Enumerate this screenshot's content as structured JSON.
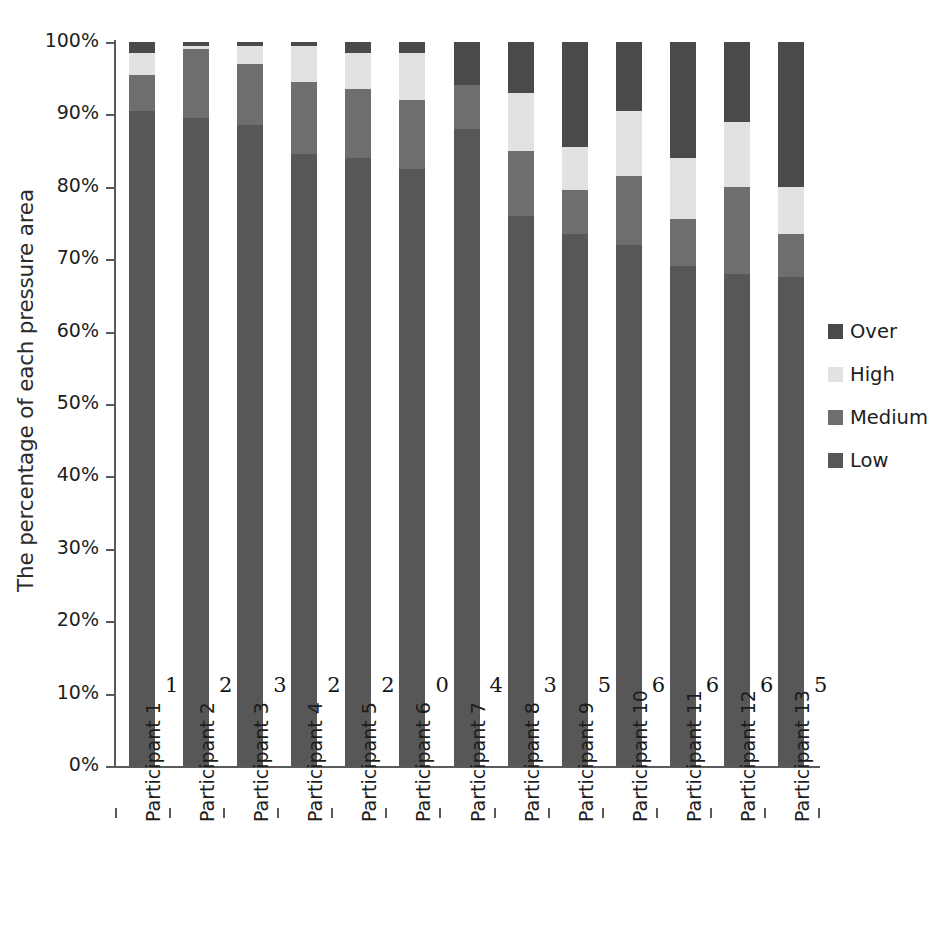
{
  "chart_data": {
    "type": "bar",
    "subtype": "stacked-bar-100-percent",
    "title": "",
    "xlabel": "",
    "ylabel": "The percentage of each pressure area",
    "ylim": [
      0,
      100
    ],
    "ytick_labels": [
      "100%",
      "90%",
      "80%",
      "70%",
      "60%",
      "50%",
      "40%",
      "30%",
      "20%",
      "10%",
      "0%"
    ],
    "ytick_values": [
      100,
      90,
      80,
      70,
      60,
      50,
      40,
      30,
      20,
      10,
      0
    ],
    "grid": false,
    "legend_position": "right",
    "categories": [
      "Participant 1",
      "Participant 2",
      "Participant 3",
      "Participant 4",
      "Participant 5",
      "Participant 6",
      "Participant 7",
      "Participant 8",
      "Participant 9",
      "Participant 10",
      "Participant 11",
      "Participant 12",
      "Participant 13"
    ],
    "series": [
      {
        "name": "Low",
        "color": "#575757",
        "values": [
          90.5,
          89.5,
          88.5,
          84.5,
          84.0,
          82.5,
          88.0,
          76.0,
          73.5,
          72.0,
          69.0,
          68.0,
          67.5
        ]
      },
      {
        "name": "Medium",
        "color": "#6e6e6e",
        "values": [
          5.0,
          9.5,
          8.5,
          10.0,
          9.5,
          9.5,
          6.0,
          9.0,
          6.0,
          9.5,
          6.5,
          12.0,
          6.0
        ]
      },
      {
        "name": "High",
        "color": "#e2e2e2",
        "values": [
          3.0,
          0.5,
          2.5,
          5.0,
          5.0,
          6.5,
          0.0,
          8.0,
          6.0,
          9.0,
          8.5,
          9.0,
          6.5
        ]
      },
      {
        "name": "Over",
        "color": "#4a4a4a",
        "values": [
          1.5,
          0.5,
          0.5,
          0.5,
          1.5,
          1.5,
          6.0,
          7.0,
          14.5,
          9.5,
          16.0,
          11.0,
          20.0
        ]
      }
    ],
    "bar_value_labels": [
      "1",
      "2",
      "3",
      "2",
      "2",
      "0",
      "4",
      "3",
      "5",
      "6",
      "6",
      "6",
      "5"
    ],
    "bar_value_label_y_percent": 11
  },
  "legend": {
    "items": [
      {
        "label": "Over",
        "color": "#4a4a4a"
      },
      {
        "label": "High",
        "color": "#e2e2e2"
      },
      {
        "label": "Medium",
        "color": "#6e6e6e"
      },
      {
        "label": "Low",
        "color": "#575757"
      }
    ]
  }
}
